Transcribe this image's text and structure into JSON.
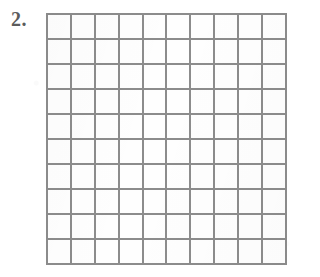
{
  "page": {
    "background_color": "#ffffff",
    "width": 302,
    "height": 277
  },
  "problem": {
    "number_label": "2.",
    "number_color": "#5c5c5c"
  },
  "grid": {
    "columns": 10,
    "rows": 10,
    "total_cells": 100,
    "line_color": "#8c8c8c",
    "line_width_px": 2,
    "cell_fill_color": "#fefefe",
    "cell_contents": [
      [
        "",
        "",
        "",
        "",
        "",
        "",
        "",
        "",
        "",
        ""
      ],
      [
        "",
        "",
        "",
        "",
        "",
        "",
        "",
        "",
        "",
        ""
      ],
      [
        "",
        "",
        "",
        "",
        "",
        "",
        "",
        "",
        "",
        ""
      ],
      [
        "",
        "",
        "",
        "",
        "",
        "",
        "",
        "",
        "",
        ""
      ],
      [
        "",
        "",
        "",
        "",
        "",
        "",
        "",
        "",
        "",
        ""
      ],
      [
        "",
        "",
        "",
        "",
        "",
        "",
        "",
        "",
        "",
        ""
      ],
      [
        "",
        "",
        "",
        "",
        "",
        "",
        "",
        "",
        "",
        ""
      ],
      [
        "",
        "",
        "",
        "",
        "",
        "",
        "",
        "",
        "",
        ""
      ],
      [
        "",
        "",
        "",
        "",
        "",
        "",
        "",
        "",
        "",
        ""
      ],
      [
        "",
        "",
        "",
        "",
        "",
        "",
        "",
        "",
        "",
        ""
      ]
    ]
  }
}
